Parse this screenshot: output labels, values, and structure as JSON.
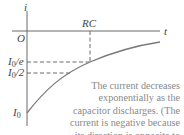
{
  "diagram": {
    "axes": {
      "y_label": "i",
      "x_label": "t",
      "origin_label": "O"
    },
    "marks": {
      "time_constant_label": "RC",
      "level_e": {
        "symbol": "I",
        "subscript": "0",
        "suffix": "/e"
      },
      "level_half": {
        "symbol": "I",
        "subscript": "0",
        "suffix": "/2"
      },
      "initial": {
        "symbol": "I",
        "subscript": "0"
      }
    },
    "caption": "The current decreases exponentially as the capacitor discharges. (The current is negative because its direction is opposite to that in Fig. 26.22.)",
    "colors": {
      "axis": "#6b6b6b",
      "curve": "#7a7a7a",
      "dashed": "#6b6b6b",
      "caption_text": "#8a8a8a"
    }
  }
}
